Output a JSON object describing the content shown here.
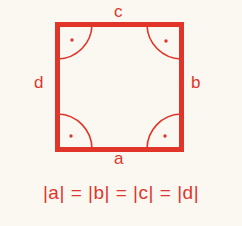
{
  "figure": {
    "shape": "square",
    "color": "#e2352a",
    "labels": {
      "top": "c",
      "right": "b",
      "bottom": "a",
      "left": "d"
    },
    "corner_marks": [
      "right-angle",
      "right-angle",
      "right-angle",
      "right-angle"
    ],
    "equation": "|a| = |b| = |c| = |d|"
  }
}
